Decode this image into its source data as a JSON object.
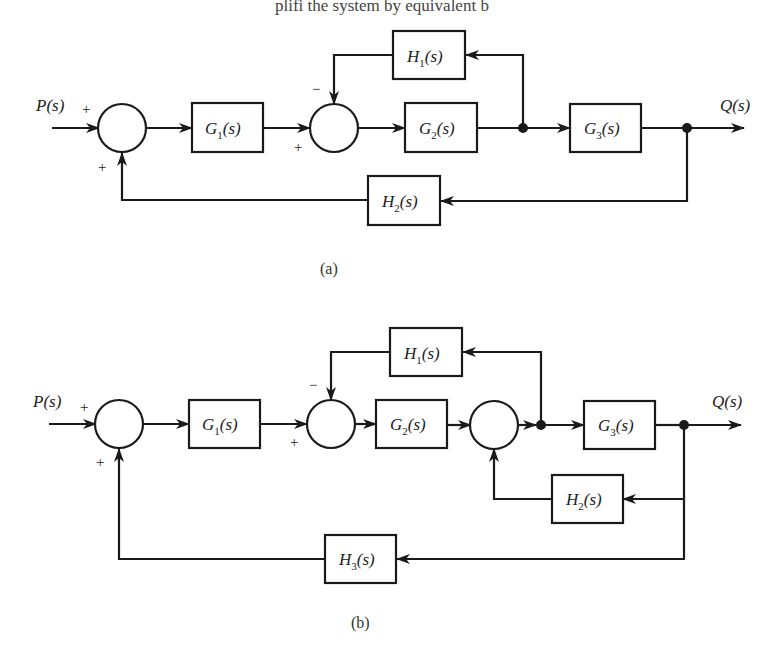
{
  "header_text": "plifi the system by equivalent b",
  "diagram_a": {
    "caption": "(a)",
    "input_label": "P(s)",
    "output_label": "Q(s)",
    "blocks": [
      {
        "id": "G1",
        "name": "G",
        "sub": "1",
        "rest": "(s)"
      },
      {
        "id": "G2",
        "name": "G",
        "sub": "2",
        "rest": "(s)"
      },
      {
        "id": "G3",
        "name": "G",
        "sub": "3",
        "rest": "(s)"
      },
      {
        "id": "H1",
        "name": "H",
        "sub": "1",
        "rest": "(s)"
      },
      {
        "id": "H2",
        "name": "H",
        "sub": "2",
        "rest": "(s)"
      }
    ],
    "signs": {
      "sum1_input": "+",
      "sum1_feedback": "+",
      "sum2_input": "+",
      "sum2_feedback": "−"
    }
  },
  "diagram_b": {
    "caption": "(b)",
    "input_label": "P(s)",
    "output_label": "Q(s)",
    "blocks": [
      {
        "id": "G1",
        "name": "G",
        "sub": "1",
        "rest": "(s)"
      },
      {
        "id": "G2",
        "name": "G",
        "sub": "2",
        "rest": "(s)"
      },
      {
        "id": "G3",
        "name": "G",
        "sub": "3",
        "rest": "(s)"
      },
      {
        "id": "H1",
        "name": "H",
        "sub": "1",
        "rest": "(s)"
      },
      {
        "id": "H2",
        "name": "H",
        "sub": "2",
        "rest": "(s)"
      },
      {
        "id": "H3",
        "name": "H",
        "sub": "3",
        "rest": "(s)"
      }
    ],
    "signs": {
      "sum1_input": "+",
      "sum1_feedback": "+",
      "sum2_input": "+",
      "sum2_feedback": "−"
    }
  }
}
